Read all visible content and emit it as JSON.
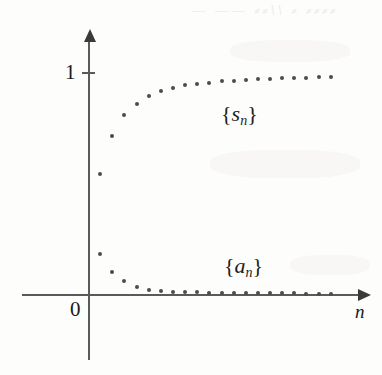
{
  "figure": {
    "background_color": "#fdfdfc",
    "ink_color": "#4c4c4c",
    "axis_color": "#5a5a5a"
  },
  "axes": {
    "origin_label": "0",
    "y_tick_label": "1",
    "x_axis_label": "n",
    "y_axis_label": "",
    "x_arrow_icon": "right-arrow-icon",
    "y_arrow_icon": "up-arrow-icon"
  },
  "annotations": [
    {
      "id": "s-series",
      "brace_open": "{",
      "symbol": "s",
      "subscript": "n",
      "brace_close": "}"
    },
    {
      "id": "a-series",
      "brace_open": "{",
      "symbol": "a",
      "subscript": "n",
      "brace_close": "}"
    }
  ],
  "bleed_text": [
    {
      "text": "—  ——   ⸗⸗\\\\  ⸗  ⸗⸗⸗⸗"
    }
  ],
  "chart_data": {
    "type": "scatter",
    "title": "",
    "subtitle": "",
    "xlabel": "n",
    "ylabel": "",
    "grid": false,
    "legend_position": "inline-annotation",
    "xlim": [
      0,
      22
    ],
    "ylim": [
      0,
      1.15
    ],
    "y_ticks": [
      1
    ],
    "y_tick_labels": [
      "1"
    ],
    "x_ticks": [],
    "x_tick_labels": [],
    "origin_label": "0",
    "series": [
      {
        "name": "{s_n}",
        "label_brace": "{s_n}",
        "color": "#4c4c4c",
        "marker": "dot",
        "x": [
          1,
          2,
          3,
          4,
          5,
          6,
          7,
          8,
          9,
          10,
          11,
          12,
          13,
          14,
          15,
          16,
          17,
          18,
          19,
          20
        ],
        "values": [
          0.545,
          0.717,
          0.808,
          0.861,
          0.894,
          0.918,
          0.933,
          0.944,
          0.952,
          0.957,
          0.962,
          0.966,
          0.969,
          0.971,
          0.974,
          0.976,
          0.978,
          0.979,
          0.981,
          0.982
        ]
      },
      {
        "name": "{a_n}",
        "label_brace": "{a_n}",
        "color": "#4c4c4c",
        "marker": "dot",
        "x": [
          1,
          2,
          3,
          4,
          5,
          6,
          7,
          8,
          9,
          10,
          11,
          12,
          13,
          14,
          15,
          16,
          17,
          18,
          19,
          20
        ],
        "values": [
          0.182,
          0.098,
          0.061,
          0.033,
          0.02,
          0.014,
          0.01,
          0.008,
          0.007,
          0.006,
          0.005,
          0.005,
          0.004,
          0.004,
          0.003,
          0.003,
          0.003,
          0.002,
          0.002,
          0.002
        ]
      }
    ]
  }
}
